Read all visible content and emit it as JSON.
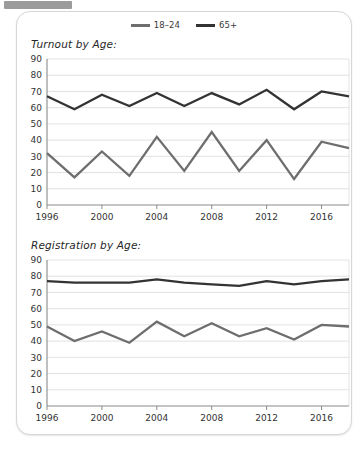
{
  "top_bar": {
    "name": "truncated-toolbar-bar",
    "color": "#9b9b9b"
  },
  "legend": {
    "position": "top-center",
    "items": [
      {
        "label": "18–24",
        "color": "#6e6e6e",
        "icon": "line-swatch-icon"
      },
      {
        "label": "65+",
        "color": "#333333",
        "icon": "line-swatch-icon"
      }
    ]
  },
  "chart_data": [
    {
      "type": "line",
      "title": "Turnout by Age:",
      "xlabel": "",
      "ylabel": "",
      "ylim": [
        0,
        90
      ],
      "yticks": [
        0,
        10,
        20,
        30,
        40,
        50,
        60,
        70,
        80,
        90
      ],
      "xlim": [
        1996,
        2018
      ],
      "xticks": [
        1996,
        2000,
        2004,
        2008,
        2012,
        2016
      ],
      "xtick_labels": [
        "1996",
        "2000",
        "2004",
        "2008",
        "2012",
        "2016"
      ],
      "grid": true,
      "legend_position": "top-center",
      "x": [
        1996,
        1998,
        2000,
        2002,
        2004,
        2006,
        2008,
        2010,
        2012,
        2014,
        2016,
        2018
      ],
      "series": [
        {
          "name": "18–24",
          "color": "#6e6e6e",
          "values": [
            32,
            17,
            33,
            18,
            42,
            21,
            45,
            21,
            40,
            16,
            39,
            35
          ]
        },
        {
          "name": "65+",
          "color": "#333333",
          "values": [
            67,
            59,
            68,
            61,
            69,
            61,
            69,
            62,
            71,
            59,
            70,
            67
          ]
        }
      ]
    },
    {
      "type": "line",
      "title": "Registration by Age:",
      "xlabel": "",
      "ylabel": "",
      "ylim": [
        0,
        90
      ],
      "yticks": [
        0,
        10,
        20,
        30,
        40,
        50,
        60,
        70,
        80,
        90
      ],
      "xlim": [
        1996,
        2018
      ],
      "xticks": [
        1996,
        2000,
        2004,
        2008,
        2012,
        2016
      ],
      "xtick_labels": [
        "1996",
        "2000",
        "2004",
        "2008",
        "2012",
        "2016"
      ],
      "grid": true,
      "legend_position": "top-center",
      "x": [
        1996,
        1998,
        2000,
        2002,
        2004,
        2006,
        2008,
        2010,
        2012,
        2014,
        2016,
        2018
      ],
      "series": [
        {
          "name": "18–24",
          "color": "#6e6e6e",
          "values": [
            49,
            40,
            46,
            39,
            52,
            43,
            51,
            43,
            48,
            41,
            50,
            49
          ]
        },
        {
          "name": "65+",
          "color": "#333333",
          "values": [
            77,
            76,
            76,
            76,
            78,
            76,
            75,
            74,
            77,
            75,
            77,
            78
          ]
        }
      ]
    }
  ]
}
